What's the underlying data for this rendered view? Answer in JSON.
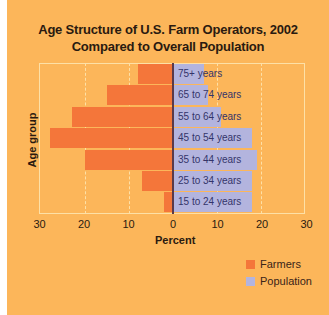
{
  "chart_data": {
    "type": "bar",
    "orientation": "horizontal",
    "subtype": "population-pyramid",
    "title": "Age Structure of U.S. Farm Operators, 2002",
    "subtitle": "Compared to Overall Population",
    "xlabel": "Percent",
    "ylabel": "Age group",
    "xlim": [
      -30,
      30
    ],
    "x_ticks": [
      "30",
      "20",
      "10",
      "0",
      "10",
      "20",
      "30"
    ],
    "categories": [
      "75+ years",
      "65 to 74 years",
      "55 to 64 years",
      "45 to 54 years",
      "35 to 44 years",
      "25 to 34 years",
      "15 to 24 years"
    ],
    "series": [
      {
        "name": "Farmers",
        "side": "left",
        "color": "#F4763A",
        "values": [
          8,
          15,
          23,
          28,
          20,
          7,
          2
        ]
      },
      {
        "name": "Population",
        "side": "right",
        "color": "#B3B4DE",
        "values": [
          7,
          8,
          11,
          18,
          19,
          18,
          18
        ]
      }
    ],
    "grid": true,
    "legend_position": "bottom-right"
  },
  "title_line1": "Age Structure of U.S. Farm Operators, 2002",
  "title_line2": "Compared to Overall Population",
  "axis": {
    "xlabel": "Percent",
    "ylabel": "Age group",
    "ticks": [
      "30",
      "20",
      "10",
      "0",
      "10",
      "20",
      "30"
    ]
  },
  "labels": [
    "75+ years",
    "65 to 74 years",
    "55 to 64 years",
    "45 to 54 years",
    "35 to 44 years",
    "25 to 34 years",
    "15 to 24 years"
  ],
  "legend": {
    "farmers": "Farmers",
    "population": "Population"
  },
  "colors": {
    "background": "#FCB65A",
    "farmers": "#F4763A",
    "population": "#B3B4DE"
  }
}
